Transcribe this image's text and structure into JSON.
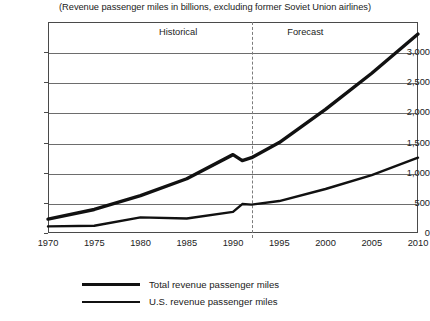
{
  "chart_data": {
    "type": "line",
    "title": "(Revenue passenger miles in billions, excluding former Soviet Union airlines)",
    "xlabel": "",
    "ylabel": "",
    "grid": true,
    "legend_position": "bottom-left",
    "xlim": [
      1970,
      2010
    ],
    "ylim": [
      0,
      3500
    ],
    "yticks": [
      0,
      500,
      1000,
      1500,
      2000,
      2500,
      3000
    ],
    "ytick_labels": [
      "0",
      "500",
      "1,000",
      "1,500",
      "2,000",
      "2,500",
      "3,000"
    ],
    "xticks": [
      1970,
      1975,
      1980,
      1985,
      1990,
      1995,
      2000,
      2005,
      2010
    ],
    "xtick_labels": [
      "1970",
      "1975",
      "1980",
      "1985",
      "1990",
      "1995",
      "2000",
      "2005",
      "2010"
    ],
    "annotations": [
      {
        "text": "Historical",
        "x": 1987
      },
      {
        "text": "Forecast",
        "x": 1995
      }
    ],
    "divider": {
      "x": 1992,
      "style": "dashed"
    },
    "x": [
      1970,
      1975,
      1980,
      1985,
      1990,
      1991,
      1992,
      1995,
      2000,
      2005,
      2010
    ],
    "series": [
      {
        "name": "Total revenue passenger miles",
        "values": [
          230,
          390,
          620,
          900,
          1300,
          1200,
          1250,
          1500,
          2050,
          2650,
          3300
        ]
      },
      {
        "name": "U.S. revenue passenger miles",
        "values": [
          110,
          120,
          260,
          240,
          350,
          480,
          470,
          530,
          730,
          960,
          1250
        ]
      }
    ]
  },
  "legend": {
    "items": [
      {
        "label": "Total revenue passenger miles"
      },
      {
        "label": "U.S. revenue passenger miles"
      }
    ]
  },
  "footer": {
    "scrap_text": ""
  }
}
